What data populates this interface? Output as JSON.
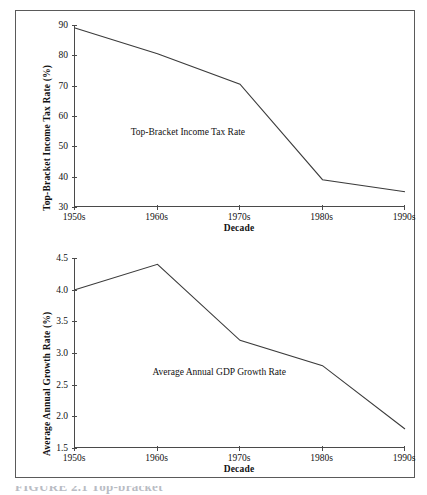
{
  "figure": {
    "caption_partial": "FIGURE 2.1  Top-bracket"
  },
  "chart_data": [
    {
      "id": "top-bracket-income-tax-rate",
      "type": "line",
      "title": "",
      "xlabel": "Decade",
      "ylabel": "Top-Bracket Income Tax Rate (%)",
      "categories": [
        "1950s",
        "1960s",
        "1970s",
        "1980s",
        "1990s"
      ],
      "values": [
        89,
        80.5,
        70.5,
        39,
        35
      ],
      "series": [
        {
          "name": "Top-Bracket Income Tax Rate",
          "values": [
            89,
            80.5,
            70.5,
            39,
            35
          ]
        }
      ],
      "annotation": "Top-Bracket Income Tax Rate",
      "ylim": [
        30,
        90
      ],
      "yticks": [
        "30",
        "40",
        "50",
        "60",
        "70",
        "80",
        "90"
      ],
      "ytick_values": [
        30,
        40,
        50,
        60,
        70,
        80,
        90
      ],
      "grid": false,
      "legend": "none",
      "line_color": "#3b3b3b"
    },
    {
      "id": "average-annual-gdp-growth-rate",
      "type": "line",
      "title": "",
      "xlabel": "Decade",
      "ylabel": "Average Annual Growth Rate (%)",
      "categories": [
        "1950s",
        "1960s",
        "1970s",
        "1980s",
        "1990s"
      ],
      "values": [
        4.0,
        4.4,
        3.2,
        2.8,
        1.8
      ],
      "series": [
        {
          "name": "Average Annual GDP Growth Rate",
          "values": [
            4.0,
            4.4,
            3.2,
            2.8,
            1.8
          ]
        }
      ],
      "annotation": "Average Annual GDP Growth Rate",
      "ylim": [
        1.5,
        4.5
      ],
      "yticks": [
        "1.5",
        "2.0",
        "2.5",
        "3.0",
        "3.5",
        "4.0",
        "4.5"
      ],
      "ytick_values": [
        1.5,
        2.0,
        2.5,
        3.0,
        3.5,
        4.0,
        4.5
      ],
      "grid": false,
      "legend": "none",
      "line_color": "#3b3b3b"
    }
  ]
}
